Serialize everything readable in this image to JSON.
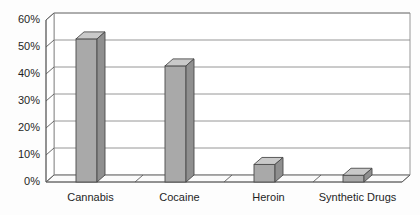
{
  "chart_data": {
    "type": "bar",
    "title": "",
    "xlabel": "",
    "ylabel": "",
    "categories": [
      "Cannabis",
      "Cocaine",
      "Heroin",
      "Synthetic Drugs"
    ],
    "values": [
      53,
      43,
      6.5,
      2.5
    ],
    "value_labels": [
      "53%",
      "43%",
      "6.5%",
      "2.5%"
    ],
    "ylim": [
      0,
      60
    ],
    "ytick_values": [
      0,
      10,
      20,
      30,
      40,
      50,
      60
    ],
    "ytick_labels": [
      "0%",
      "10%",
      "20%",
      "30%",
      "40%",
      "50%",
      "60%"
    ],
    "grid": true,
    "grid_axis": "y",
    "legend": "none",
    "style": "3d-column",
    "colors": {
      "bar_front": "#a9a9a9",
      "bar_top": "#c9c9c9",
      "bar_side": "#8f8f8f",
      "bar_outline": "#4a4a4a",
      "grid": "#8a8a8a",
      "axis": "#5a5a5a",
      "wall": "#ffffff",
      "floor": "#fbfbfb",
      "text": "#1f1f1f",
      "background": "#fdfdfd"
    }
  },
  "axis": {
    "y_title": "",
    "x_title": ""
  }
}
